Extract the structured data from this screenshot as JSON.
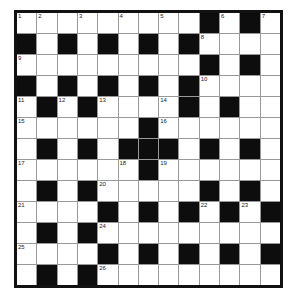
{
  "puzzle": {
    "rows": 13,
    "cols": 13,
    "layout": [
      "WWWWWWWWWBWBW",
      "BWBWBWBWBWWWW",
      "WWWWWWWWWBWBW",
      "BWBWBWBWBWWWW",
      "WBWBWWWWBWBWW",
      "WWWWWWBWWWWWW",
      "WBWBWBBBWBWBW",
      "WWWWWWBWWWWWW",
      "WBWBWWWWWBWBW",
      "WWWWBWBWBWBWB",
      "WBWBWWWWWWWWW",
      "WWWWBWBWBWBWB",
      "WBWBWWWWWWWWW"
    ],
    "numbers": [
      {
        "r": 0,
        "c": 0,
        "n": "1"
      },
      {
        "r": 0,
        "c": 1,
        "n": "2"
      },
      {
        "r": 0,
        "c": 3,
        "n": "3"
      },
      {
        "r": 0,
        "c": 5,
        "n": "4"
      },
      {
        "r": 0,
        "c": 7,
        "n": "5"
      },
      {
        "r": 0,
        "c": 10,
        "n": "6"
      },
      {
        "r": 0,
        "c": 12,
        "n": "7"
      },
      {
        "r": 1,
        "c": 9,
        "n": "8"
      },
      {
        "r": 2,
        "c": 0,
        "n": "9"
      },
      {
        "r": 3,
        "c": 9,
        "n": "10"
      },
      {
        "r": 4,
        "c": 0,
        "n": "11"
      },
      {
        "r": 4,
        "c": 2,
        "n": "12"
      },
      {
        "r": 4,
        "c": 4,
        "n": "13"
      },
      {
        "r": 4,
        "c": 7,
        "n": "14"
      },
      {
        "r": 5,
        "c": 0,
        "n": "15"
      },
      {
        "r": 5,
        "c": 7,
        "n": "16"
      },
      {
        "r": 7,
        "c": 0,
        "n": "17"
      },
      {
        "r": 7,
        "c": 5,
        "n": "18"
      },
      {
        "r": 7,
        "c": 7,
        "n": "19"
      },
      {
        "r": 8,
        "c": 4,
        "n": "20"
      },
      {
        "r": 9,
        "c": 0,
        "n": "21"
      },
      {
        "r": 9,
        "c": 9,
        "n": "22"
      },
      {
        "r": 9,
        "c": 11,
        "n": "23"
      },
      {
        "r": 10,
        "c": 4,
        "n": "24"
      },
      {
        "r": 11,
        "c": 0,
        "n": "25"
      },
      {
        "r": 12,
        "c": 4,
        "n": "26"
      }
    ]
  }
}
